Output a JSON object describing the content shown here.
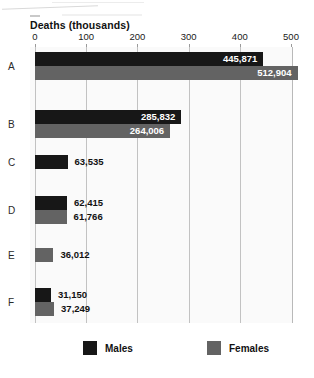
{
  "chart_data": {
    "type": "bar",
    "orientation": "horizontal",
    "title": "Deaths (thousands)",
    "xlabel": "",
    "ylabel": "",
    "xlim": [
      0,
      500
    ],
    "xticks": [
      0,
      100,
      200,
      300,
      400,
      500
    ],
    "xtick_labels": [
      "0",
      "100",
      "200",
      "300",
      "400",
      "500"
    ],
    "grid": true,
    "legend_position": "bottom",
    "categories": [
      "A",
      "B",
      "C",
      "D",
      "E",
      "F"
    ],
    "series": [
      {
        "name": "Males",
        "color": "#171717",
        "values": [
          445871,
          285832,
          63535,
          62415,
          null,
          31150
        ],
        "labels": [
          "445,871",
          "285,832",
          "63,535",
          "62,415",
          "",
          "31,150"
        ]
      },
      {
        "name": "Females",
        "color": "#636363",
        "values": [
          512904,
          264006,
          null,
          61766,
          36012,
          37249
        ],
        "labels": [
          "512,904",
          "264,006",
          "",
          "61,766",
          "36,012",
          "37,249"
        ]
      }
    ],
    "rows": [
      {
        "category": "A",
        "male_label": "445,871",
        "male_value": 445871,
        "male_label_inside": true,
        "female_label": "512,904",
        "female_value": 512904,
        "female_label_inside": true
      },
      {
        "category": "B",
        "male_label": "285,832",
        "male_value": 285832,
        "male_label_inside": true,
        "female_label": "264,006",
        "female_value": 264006,
        "female_label_inside": true
      },
      {
        "category": "C",
        "male_label": "63,535",
        "male_value": 63535,
        "male_label_inside": false,
        "female_label": "",
        "female_value": null,
        "female_label_inside": false
      },
      {
        "category": "D",
        "male_label": "62,415",
        "male_value": 62415,
        "male_label_inside": false,
        "female_label": "61,766",
        "female_value": 61766,
        "female_label_inside": false
      },
      {
        "category": "E",
        "male_label": "",
        "male_value": null,
        "male_label_inside": false,
        "female_label": "36,012",
        "female_value": 36012,
        "female_label_inside": false
      },
      {
        "category": "F",
        "male_label": "31,150",
        "male_value": 31150,
        "male_label_inside": false,
        "female_label": "37,249",
        "female_value": 37249,
        "female_label_inside": false
      }
    ]
  },
  "legend": {
    "males": "Males",
    "females": "Females"
  },
  "colors": {
    "male": "#171717",
    "female": "#636363",
    "plot_background": "#fafafa",
    "gridline": "#c2c2c2"
  }
}
